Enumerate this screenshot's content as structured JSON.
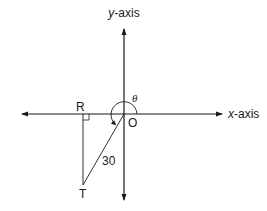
{
  "diagram": {
    "type": "coordinate-plane-angle",
    "axes": {
      "x_label_var": "x",
      "x_label_suffix": "-axis",
      "y_label_var": "y",
      "y_label_suffix": "-axis"
    },
    "points": {
      "origin": "O",
      "R": "R",
      "T": "T"
    },
    "segment_length_label": "30",
    "angle_label": "θ",
    "right_angle_at": "R",
    "colors": {
      "stroke": "#1a1a1a",
      "background": "#ffffff"
    }
  }
}
